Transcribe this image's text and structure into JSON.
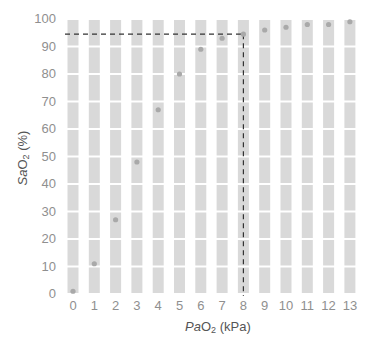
{
  "chart_data": {
    "type": "scatter",
    "title": "",
    "xlabel": "PaO2 (kPa)",
    "xlabel_parts": {
      "italic": "Pa",
      "main": "O",
      "sub": "2",
      "unit": " (kPa)"
    },
    "ylabel": "SaO2 (%)",
    "ylabel_parts": {
      "italic": "Sa",
      "main": "O",
      "sub": "2",
      "unit": " (%)"
    },
    "x_ticks": [
      "0",
      "1",
      "2",
      "3",
      "4",
      "5",
      "6",
      "7",
      "8",
      "9",
      "10",
      "11",
      "12",
      "13"
    ],
    "y_ticks": [
      "0",
      "10",
      "20",
      "30",
      "40",
      "50",
      "60",
      "70",
      "80",
      "90",
      "100"
    ],
    "xlim": [
      0,
      13
    ],
    "ylim": [
      0,
      100
    ],
    "grid": "segmented vertical bars per x tick, white gaps every 10%",
    "legend": null,
    "series": [
      {
        "name": "Oxyhaemoglobin saturation",
        "x": [
          0,
          1,
          2,
          3,
          4,
          5,
          6,
          7,
          8,
          9,
          10,
          11,
          12,
          13
        ],
        "y": [
          1,
          11,
          27,
          48,
          67,
          80,
          89,
          93,
          94.5,
          96,
          97,
          98,
          98,
          99
        ]
      }
    ],
    "annotations": [
      {
        "type": "dashed-hline",
        "y": 94.5,
        "x_from": 0,
        "x_to": 8
      },
      {
        "type": "dashed-vline",
        "x": 8,
        "y_from": 0,
        "y_to": 94.5
      }
    ],
    "colors": {
      "bar": "#d9d9d9",
      "point": "#a9a9a9",
      "dash": "#333333",
      "tick_text": "#8f8f8f",
      "axis_label": "#555555"
    }
  }
}
